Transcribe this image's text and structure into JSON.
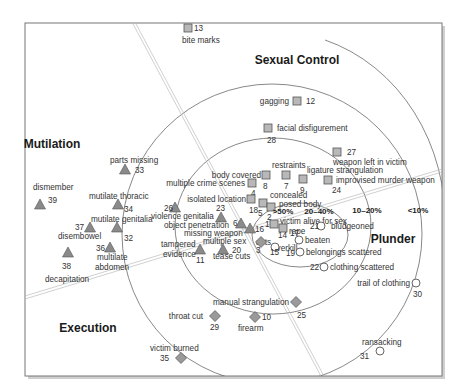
{
  "chart_data": {
    "type": "scatter",
    "title": "",
    "themes": [
      {
        "name": "Sexual Control",
        "x": 297,
        "y": 64
      },
      {
        "name": "Mutilation",
        "x": 52,
        "y": 148
      },
      {
        "name": "Plunder",
        "x": 393,
        "y": 243
      },
      {
        "name": "Execution",
        "x": 88,
        "y": 332
      }
    ],
    "rings": [
      {
        "label": ">50%",
        "x": 283,
        "y": 214
      },
      {
        "label": "20–40%",
        "x": 319,
        "y": 214
      },
      {
        "label": "10–20%",
        "x": 367,
        "y": 213
      },
      {
        "label": "<10%",
        "x": 418,
        "y": 213
      }
    ],
    "legend_shapes": {
      "square": "Sexual Control",
      "triangle": "Mutilation",
      "circle": "Plunder",
      "diamond": "Execution"
    },
    "points": [
      {
        "id": "13",
        "label": "bite marks",
        "shape": "square",
        "x": 188,
        "y": 28,
        "lx": 182,
        "ly": 43,
        "nx": 194,
        "ny": 31,
        "anchor": "start"
      },
      {
        "id": "12",
        "label": "gagging",
        "shape": "square",
        "x": 297,
        "y": 101,
        "lx": 289,
        "ly": 104,
        "nx": 306,
        "ny": 104,
        "anchor": "end"
      },
      {
        "id": "28",
        "label": "facial disfigurement",
        "shape": "square",
        "x": 268,
        "y": 128,
        "lx": 277,
        "ly": 131,
        "nx": 267,
        "ny": 143,
        "anchor": "start"
      },
      {
        "id": "27",
        "label": "weapon left in victim",
        "shape": "square",
        "x": 337,
        "y": 152,
        "lx": 333,
        "ly": 165,
        "nx": 347,
        "ny": 155,
        "anchor": "start"
      },
      {
        "id": "8",
        "label": "body covered",
        "shape": "square",
        "x": 266,
        "y": 175,
        "lx": 261,
        "ly": 178,
        "nx": 263,
        "ny": 189,
        "anchor": "end"
      },
      {
        "id": "7",
        "label": "restraints",
        "shape": "square",
        "x": 286,
        "y": 175,
        "lx": 272,
        "ly": 168,
        "nx": 284,
        "ny": 189,
        "anchor": "start"
      },
      {
        "id": "9",
        "label": "ligature strangulation",
        "shape": "square",
        "x": 303,
        "y": 179,
        "lx": 307,
        "ly": 173,
        "nx": 300,
        "ny": 193,
        "anchor": "start"
      },
      {
        "id": "24",
        "label": "improvised murder weapon",
        "shape": "square",
        "x": 328,
        "y": 180,
        "lx": 336,
        "ly": 183,
        "nx": 332,
        "ny": 193,
        "anchor": "start"
      },
      {
        "id": "4",
        "label": "multiple crime scenes",
        "shape": "square",
        "x": 252,
        "y": 183,
        "lx": 245,
        "ly": 186,
        "nx": 251,
        "ny": 196,
        "anchor": "end"
      },
      {
        "id": "18",
        "label": "isolated location",
        "shape": "square",
        "x": 251,
        "y": 199,
        "lx": 246,
        "ly": 202,
        "nx": 249,
        "ny": 213,
        "anchor": "end"
      },
      {
        "id": "5",
        "label": "concealed",
        "shape": "square",
        "x": 263,
        "y": 203,
        "lx": 270,
        "ly": 198,
        "nx": 258,
        "ny": 216,
        "anchor": "start"
      },
      {
        "id": "2",
        "label": "posed body",
        "shape": "square",
        "x": 271,
        "y": 207,
        "lx": 279,
        "ly": 207,
        "nx": 267,
        "ny": 220,
        "anchor": "start"
      },
      {
        "id": "1",
        "label": "victim alive for sex",
        "shape": "square",
        "x": 274,
        "y": 224,
        "lx": 280,
        "ly": 224,
        "nx": 265,
        "ny": 227,
        "anchor": "start"
      },
      {
        "id": "14",
        "label": "rape",
        "shape": "square",
        "x": 283,
        "y": 228,
        "lx": 289,
        "ly": 234,
        "nx": 278,
        "ny": 238,
        "anchor": "start"
      },
      {
        "id": "26",
        "label": "violence genitalia",
        "shape": "triangle",
        "x": 175,
        "y": 208,
        "lx": 151,
        "ly": 219,
        "nx": 164,
        "ny": 211,
        "anchor": "start"
      },
      {
        "id": "23",
        "label": "object penetration",
        "shape": "triangle",
        "x": 221,
        "y": 218,
        "lx": 164,
        "ly": 228,
        "nx": 216,
        "ny": 211,
        "anchor": "start"
      },
      {
        "id": "6",
        "label": "missing weapon",
        "shape": "triangle",
        "x": 241,
        "y": 224,
        "lx": 184,
        "ly": 236,
        "nx": 233,
        "ny": 226,
        "anchor": "start"
      },
      {
        "id": "16",
        "label": "acts",
        "shape": "triangle",
        "x": 250,
        "y": 229,
        "lx": 256,
        "ly": 245,
        "nx": 255,
        "ny": 232,
        "anchor": "start"
      },
      {
        "id": "11",
        "label": "tampered evidence",
        "shape": "triangle",
        "x": 200,
        "y": 250,
        "lx": 161,
        "ly": 247,
        "nx": 196,
        "ny": 263,
        "anchor": "start"
      },
      {
        "id": "20",
        "label": "multiple sex",
        "shape": "triangle",
        "x": 223,
        "y": 250,
        "lx": 203,
        "ly": 244,
        "nx": 232,
        "ny": 253,
        "anchor": "start"
      },
      {
        "id": "20b",
        "label": "tease cuts",
        "shape": "none",
        "x": 0,
        "y": 0,
        "lx": 213,
        "ly": 259,
        "nx": 0,
        "ny": 0,
        "anchor": "start"
      },
      {
        "id": "3",
        "label": "overkill",
        "shape": "diamond",
        "x": 261,
        "y": 242,
        "lx": 272,
        "ly": 251,
        "nx": 256,
        "ny": 253,
        "anchor": "start"
      },
      {
        "id": "15",
        "label": "",
        "shape": "circle",
        "x": 275,
        "y": 247,
        "lx": 0,
        "ly": 0,
        "nx": 270,
        "ny": 255,
        "anchor": "start"
      },
      {
        "id": "17",
        "label": "beaten",
        "shape": "circle",
        "x": 299,
        "y": 240,
        "lx": 305,
        "ly": 243,
        "nx": 290,
        "ny": 236,
        "anchor": "start"
      },
      {
        "id": "19",
        "label": "belongings scattered",
        "shape": "circle",
        "x": 300,
        "y": 252,
        "lx": 306,
        "ly": 255,
        "nx": 286,
        "ny": 256,
        "anchor": "start"
      },
      {
        "id": "21",
        "label": "bludgeoned",
        "shape": "circle",
        "x": 321,
        "y": 226,
        "lx": 331,
        "ly": 229,
        "nx": 310,
        "ny": 229,
        "anchor": "start"
      },
      {
        "id": "22",
        "label": "clothing scattered",
        "shape": "circle",
        "x": 324,
        "y": 267,
        "lx": 330,
        "ly": 270,
        "nx": 310,
        "ny": 270,
        "anchor": "start"
      },
      {
        "id": "30",
        "label": "trail of clothing",
        "shape": "circle",
        "x": 416,
        "y": 283,
        "lx": 410,
        "ly": 286,
        "nx": 413,
        "ny": 297,
        "anchor": "end"
      },
      {
        "id": "31",
        "label": "ransacking",
        "shape": "circle",
        "x": 380,
        "y": 351,
        "lx": 362,
        "ly": 345,
        "nx": 360,
        "ny": 359,
        "anchor": "start"
      },
      {
        "id": "33",
        "label": "parts missing",
        "shape": "triangle",
        "x": 125,
        "y": 170,
        "lx": 110,
        "ly": 163,
        "nx": 135,
        "ny": 173,
        "anchor": "start"
      },
      {
        "id": "39",
        "label": "dismember",
        "shape": "triangle",
        "x": 40,
        "y": 205,
        "lx": 33,
        "ly": 190,
        "nx": 48,
        "ny": 203,
        "anchor": "start"
      },
      {
        "id": "34",
        "label": "mutilate thoracic",
        "shape": "triangle",
        "x": 118,
        "y": 205,
        "lx": 89,
        "ly": 199,
        "nx": 124,
        "ny": 212,
        "anchor": "start"
      },
      {
        "id": "37",
        "label": "disembowel",
        "shape": "triangle",
        "x": 90,
        "y": 228,
        "lx": 58,
        "ly": 239,
        "nx": 75,
        "ny": 230,
        "anchor": "start"
      },
      {
        "id": "32",
        "label": "mutilate genitalia",
        "shape": "triangle",
        "x": 117,
        "y": 228,
        "lx": 91,
        "ly": 222,
        "nx": 124,
        "ny": 241,
        "anchor": "start"
      },
      {
        "id": "38",
        "label": "decapitation",
        "shape": "triangle",
        "x": 68,
        "y": 253,
        "lx": 45,
        "ly": 282,
        "nx": 62,
        "ny": 269,
        "anchor": "start"
      },
      {
        "id": "36",
        "label": "multilate abdomen",
        "shape": "triangle",
        "x": 110,
        "y": 248,
        "lx": 97,
        "ly": 260,
        "nx": 96,
        "ny": 251,
        "anchor": "start"
      },
      {
        "id": "25",
        "label": "manual strangulation",
        "shape": "diamond",
        "x": 296,
        "y": 302,
        "lx": 289,
        "ly": 305,
        "nx": 297,
        "ny": 318,
        "anchor": "end"
      },
      {
        "id": "29",
        "label": "throat cut",
        "shape": "diamond",
        "x": 215,
        "y": 316,
        "lx": 203,
        "ly": 319,
        "nx": 210,
        "ny": 330,
        "anchor": "end"
      },
      {
        "id": "10",
        "label": "firearm",
        "shape": "diamond",
        "x": 255,
        "y": 317,
        "lx": 238,
        "ly": 331,
        "nx": 262,
        "ny": 320,
        "anchor": "start"
      },
      {
        "id": "35",
        "label": "victim burned",
        "shape": "diamond",
        "x": 181,
        "y": 358,
        "lx": 150,
        "ly": 351,
        "nx": 160,
        "ny": 361,
        "anchor": "start"
      }
    ],
    "xlabel": "",
    "ylabel": "",
    "grid": false
  },
  "text": {
    "tease_cuts": "tease cuts",
    "multilate_line2": "abdomen",
    "tampered_line2": "evidence"
  }
}
